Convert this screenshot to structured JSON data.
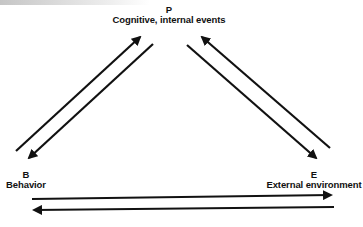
{
  "diagram": {
    "nodes": [
      {
        "id": "P",
        "letter": "P",
        "label": "Cognitive, internal events",
        "position": "top-center"
      },
      {
        "id": "B",
        "letter": "B",
        "label": "Behavior",
        "position": "bottom-left"
      },
      {
        "id": "E",
        "letter": "E",
        "label": "External environment",
        "position": "bottom-right"
      }
    ],
    "edges": [
      {
        "from": "B",
        "to": "P",
        "direction": "up-right"
      },
      {
        "from": "P",
        "to": "B",
        "direction": "down-left"
      },
      {
        "from": "E",
        "to": "P",
        "direction": "up-left"
      },
      {
        "from": "P",
        "to": "E",
        "direction": "down-right"
      },
      {
        "from": "B",
        "to": "E",
        "direction": "right"
      },
      {
        "from": "E",
        "to": "B",
        "direction": "left"
      }
    ],
    "colors": {
      "stroke": "#111111",
      "text": "#111111",
      "background": "#ffffff"
    }
  }
}
